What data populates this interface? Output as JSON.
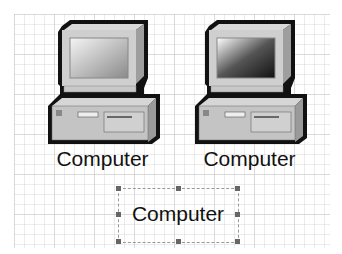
{
  "diagram": {
    "shapes": [
      {
        "type": "computer",
        "label": "Computer",
        "screen": "light"
      },
      {
        "type": "computer",
        "label": "Computer",
        "screen": "dark"
      }
    ],
    "selected_text": {
      "label": "Computer"
    }
  },
  "colors": {
    "grid": "#d8d8d8",
    "handle": "#666666",
    "outline": "#111111",
    "body": "#bdbdbd"
  }
}
